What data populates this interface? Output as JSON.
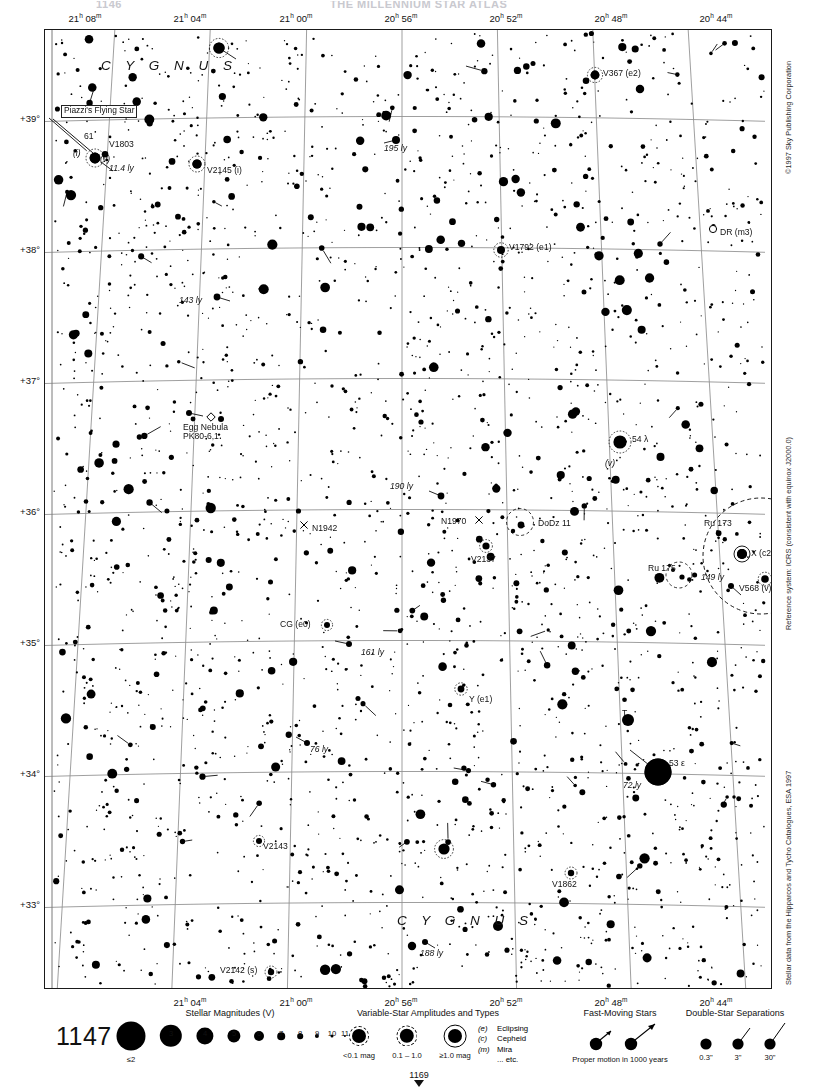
{
  "header": {
    "page_number_fragment": "1146",
    "title_fragment": "THE MILLENNIUM STAR ATLAS"
  },
  "chart": {
    "number": "1147",
    "next_chart_number": "1169",
    "constellation_labels": [
      "C Y G N U S",
      "C Y G N U S"
    ]
  },
  "axes": {
    "ra_ticks_top": [
      {
        "label": "21h 08m",
        "h": "21",
        "m": "08"
      },
      {
        "label": "21h 04m",
        "h": "21",
        "m": "04"
      },
      {
        "label": "21h 00m",
        "h": "21",
        "m": "00"
      },
      {
        "label": "20h 56m",
        "h": "20",
        "m": "56"
      },
      {
        "label": "20h 52m",
        "h": "20",
        "m": "52"
      },
      {
        "label": "20h 48m",
        "h": "20",
        "m": "48"
      },
      {
        "label": "20h 44m",
        "h": "20",
        "m": "44"
      }
    ],
    "ra_ticks_bottom": [
      {
        "h": "21",
        "m": "04"
      },
      {
        "h": "21",
        "m": "00"
      },
      {
        "h": "20",
        "m": "56"
      },
      {
        "h": "20",
        "m": "52"
      },
      {
        "h": "20",
        "m": "48"
      },
      {
        "h": "20",
        "m": "44"
      }
    ],
    "dec_ticks": [
      "+39°",
      "+38°",
      "+37°",
      "+36°",
      "+35°",
      "+34°",
      "+33°"
    ]
  },
  "credits": {
    "copyright": "©1997 Sky Publishing Corporation",
    "reference": "Reference system: ICRS (consistent with equinox J2000.0)",
    "source": "Stellar data from the Hipparcos and Tycho Catalogues, ESA 1997"
  },
  "map_labels": [
    {
      "text": "Piazzi's Flying Star",
      "kind": "boxed"
    },
    {
      "text": "61",
      "kind": "plain"
    },
    {
      "text": "V1803",
      "kind": "plain"
    },
    {
      "text": "(i)",
      "kind": "italic"
    },
    {
      "text": "(v)",
      "kind": "italic"
    },
    {
      "text": "11.4 ly",
      "kind": "italic"
    },
    {
      "text": "V2145 (i)",
      "kind": "plain"
    },
    {
      "text": "V367 (e2)",
      "kind": "plain"
    },
    {
      "text": "195 ly",
      "kind": "italic"
    },
    {
      "text": "DR (m3)",
      "kind": "plain"
    },
    {
      "text": "V1792 (e1)",
      "kind": "plain"
    },
    {
      "text": "143 ly",
      "kind": "italic"
    },
    {
      "text": "Egg Nebula",
      "kind": "plain"
    },
    {
      "text": "PK80-6,1",
      "kind": "plain"
    },
    {
      "text": "54 λ",
      "kind": "plain"
    },
    {
      "text": "190 ly",
      "kind": "italic"
    },
    {
      "text": "N1942",
      "kind": "plain"
    },
    {
      "text": "N1970",
      "kind": "plain"
    },
    {
      "text": "DoDz 11",
      "kind": "plain"
    },
    {
      "text": "Ru 173",
      "kind": "plain"
    },
    {
      "text": "Ru 175",
      "kind": "plain"
    },
    {
      "text": "X (c2)",
      "kind": "plain"
    },
    {
      "text": "149 ly",
      "kind": "italic"
    },
    {
      "text": "V568 (v)",
      "kind": "plain"
    },
    {
      "text": "V2137",
      "kind": "plain"
    },
    {
      "text": "CG (e0)",
      "kind": "plain"
    },
    {
      "text": "161 ly",
      "kind": "italic"
    },
    {
      "text": "Y (e1)",
      "kind": "plain"
    },
    {
      "text": "76 ly",
      "kind": "italic"
    },
    {
      "text": "T",
      "kind": "plain"
    },
    {
      "text": "53 ε",
      "kind": "plain"
    },
    {
      "text": "72 ly",
      "kind": "italic"
    },
    {
      "text": "V2143",
      "kind": "plain"
    },
    {
      "text": "V2142 (s)",
      "kind": "plain"
    },
    {
      "text": "V1862",
      "kind": "plain"
    },
    {
      "text": "188 ly",
      "kind": "italic"
    }
  ],
  "legend": {
    "magnitudes": {
      "title": "Stellar Magnitudes (V)",
      "labels": [
        "≤2",
        "3",
        "4",
        "5",
        "6",
        "7",
        "8",
        "9",
        "10",
        "11"
      ]
    },
    "variables": {
      "title": "Variable-Star Amplitudes and Types",
      "amplitudes": [
        "<0.1 mag",
        "0.1 – 1.0",
        "≥1.0 mag"
      ],
      "types": [
        {
          "key": "(e)",
          "name": "Eclipsing"
        },
        {
          "key": "(c)",
          "name": "Cepheid"
        },
        {
          "key": "(m)",
          "name": "Mira"
        },
        {
          "key": "",
          "name": "... etc."
        }
      ]
    },
    "fast_moving": {
      "title": "Fast-Moving Stars",
      "caption": "Proper motion in 1000 years"
    },
    "doubles": {
      "title": "Double-Star Separations",
      "labels": [
        "0.3\"",
        "3\"",
        "30\""
      ]
    }
  },
  "chart_data": {
    "type": "scatter",
    "xlabel": "Right Ascension",
    "ylabel": "Declination",
    "xlim": [
      "21h 09m",
      "20h 43m"
    ],
    "ylim": [
      "+32.6°",
      "+39.4°"
    ],
    "grid": true
  }
}
